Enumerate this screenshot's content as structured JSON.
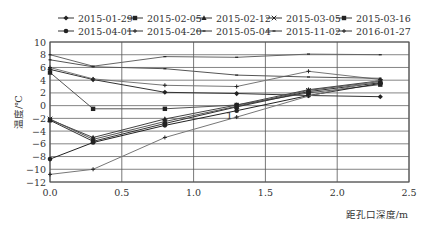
{
  "chart_data": {
    "type": "line",
    "title": "",
    "xlabel": "距孔口深度/m",
    "ylabel": "温度/℃",
    "xlim": [
      0.0,
      2.5
    ],
    "ylim": [
      -12,
      10
    ],
    "xticks": [
      "0.0",
      "0.5",
      "1.0",
      "1.5",
      "2.0",
      "2.5"
    ],
    "xtick_values": [
      0.0,
      0.5,
      1.0,
      1.5,
      2.0,
      2.5
    ],
    "yticks": [
      "10",
      "8",
      "6",
      "4",
      "2",
      "0",
      "-2",
      "-4",
      "-6",
      "-8",
      "-10",
      "-12"
    ],
    "ytick_values": [
      10,
      8,
      6,
      4,
      2,
      0,
      -2,
      -4,
      -6,
      -8,
      -10,
      -12
    ],
    "grid": true,
    "legend_position": "top",
    "annotations": [
      {
        "text": "1",
        "x": 1.25,
        "y": -1.7
      }
    ],
    "x": [
      0.0,
      0.3,
      0.8,
      1.3,
      1.8,
      2.3
    ],
    "series": [
      {
        "name": "2015-01-29",
        "marker": "diamond",
        "values": [
          5.7,
          4.1,
          2.1,
          1.9,
          1.6,
          1.4
        ]
      },
      {
        "name": "2015-02-05",
        "marker": "square",
        "values": [
          5.2,
          -0.5,
          -0.5,
          0.1,
          2.0,
          3.3
        ]
      },
      {
        "name": "2015-02-12",
        "marker": "triangle",
        "values": [
          -2.2,
          -5.0,
          -2.1,
          0.1,
          2.5,
          3.9
        ]
      },
      {
        "name": "2015-03-05",
        "marker": "x",
        "values": [
          -2.1,
          -5.3,
          -2.5,
          -0.1,
          2.4,
          3.8
        ]
      },
      {
        "name": "2015-03-16",
        "marker": "square",
        "values": [
          -2.3,
          -5.6,
          -2.8,
          -0.2,
          2.2,
          3.6
        ]
      },
      {
        "name": "2015-04-01",
        "marker": "dot",
        "values": [
          -8.4,
          -5.8,
          -3.1,
          -0.8,
          1.6,
          3.5
        ]
      },
      {
        "name": "2015-04-20",
        "marker": "plus",
        "values": [
          6.0,
          4.2,
          3.2,
          3.0,
          5.4,
          4.1
        ]
      },
      {
        "name": "2015-05-04",
        "marker": "dash",
        "values": [
          7.2,
          6.1,
          5.8,
          4.8,
          4.5,
          4.3
        ]
      },
      {
        "name": "2015-11-02",
        "marker": "dash",
        "values": [
          8.0,
          6.2,
          7.7,
          7.6,
          8.1,
          8.0
        ]
      },
      {
        "name": "2016-01-27",
        "marker": "plus",
        "values": [
          -10.8,
          -10.0,
          -5.0,
          -1.8,
          1.5,
          4.0
        ]
      }
    ]
  }
}
